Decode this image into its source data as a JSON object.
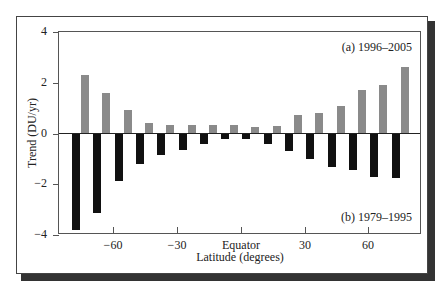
{
  "chart_data": {
    "type": "bar",
    "title": "",
    "xlabel": "Latitude (degrees)",
    "ylabel": "Trend (DU/yr)",
    "ylim": [
      -4,
      4
    ],
    "yticks": [
      "4",
      "2",
      "0",
      "-2",
      "-4"
    ],
    "xticks": [
      "−60",
      "−30",
      "Equator",
      "30",
      "60"
    ],
    "categories": [
      -75,
      -65,
      -55,
      -45,
      -35,
      -25,
      -15,
      -5,
      5,
      15,
      25,
      35,
      45,
      55,
      65,
      75
    ],
    "series": [
      {
        "name": "(b) 1979–1995",
        "color": "#111111",
        "values": [
          -3.8,
          -3.13,
          -1.88,
          -1.2,
          -0.86,
          -0.63,
          -0.43,
          -0.2,
          -0.2,
          -0.43,
          -0.67,
          -1.0,
          -1.33,
          -1.45,
          -1.73,
          -1.77
        ]
      },
      {
        "name": "(a) 1996–2005",
        "color": "#8a8a8a",
        "values": [
          2.31,
          1.58,
          0.94,
          0.43,
          0.35,
          0.35,
          0.35,
          0.35,
          0.27,
          0.31,
          0.71,
          0.82,
          1.1,
          1.72,
          1.92,
          2.63
        ]
      }
    ],
    "legend": {
      "upper_label": "(a) 1996–2005",
      "lower_label": "(b) 1979–1995"
    },
    "grid": false
  }
}
